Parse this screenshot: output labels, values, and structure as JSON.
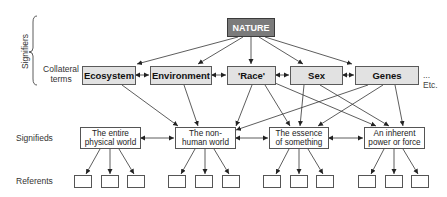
{
  "levels": {
    "signifiers": "Signifiers",
    "collateral": "Collateral terms",
    "collateral_line1": "Collateral",
    "collateral_line2": "terms",
    "signifieds": "Signifieds",
    "referents": "Referents"
  },
  "root": {
    "label": "NATURE",
    "color": "#7b7b7b"
  },
  "collateral_terms": [
    {
      "label": "Ecosystem"
    },
    {
      "label": "Environment"
    },
    {
      "label": "'Race'"
    },
    {
      "label": "Sex"
    },
    {
      "label": "Genes"
    }
  ],
  "etc": "... Etc.",
  "signifieds": [
    {
      "line1": "The entire",
      "line2": "physical world"
    },
    {
      "line1": "The non-",
      "line2": "human world"
    },
    {
      "line1": "The essence",
      "line2": "of something"
    },
    {
      "line1": "An inherent",
      "line2": "power or force"
    }
  ],
  "referents_per_signified": 3,
  "colors": {
    "collateral_fill": "#e2e2e2",
    "root_fill": "#7b7b7b",
    "line": "#333333"
  }
}
